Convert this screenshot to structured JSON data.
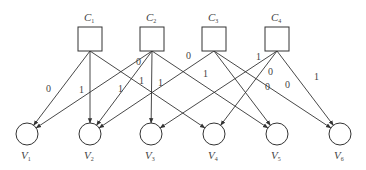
{
  "diagram": {
    "type": "bipartite-graph",
    "colors": {
      "stroke": "#333333",
      "text": "#444444",
      "background": "#ffffff"
    },
    "check_nodes": [
      {
        "id": "C1",
        "label": "C",
        "sub": "1",
        "x": 90,
        "y": 39
      },
      {
        "id": "C2",
        "label": "C",
        "sub": "2",
        "x": 152,
        "y": 39
      },
      {
        "id": "C3",
        "label": "C",
        "sub": "3",
        "x": 214,
        "y": 39
      },
      {
        "id": "C4",
        "label": "C",
        "sub": "4",
        "x": 277,
        "y": 39
      }
    ],
    "variable_nodes": [
      {
        "id": "V1",
        "label": "V",
        "sub": "1",
        "x": 27,
        "y": 134
      },
      {
        "id": "V2",
        "label": "V",
        "sub": "2",
        "x": 90,
        "y": 134
      },
      {
        "id": "V3",
        "label": "V",
        "sub": "3",
        "x": 151,
        "y": 134
      },
      {
        "id": "V4",
        "label": "V",
        "sub": "4",
        "x": 214,
        "y": 134
      },
      {
        "id": "V5",
        "label": "V",
        "sub": "5",
        "x": 277,
        "y": 134
      },
      {
        "id": "V6",
        "label": "V",
        "sub": "6",
        "x": 340,
        "y": 134
      }
    ],
    "edges": [
      {
        "from": "C1",
        "to": "V1",
        "label": "0",
        "lx": 46,
        "ly": 92
      },
      {
        "from": "C1",
        "to": "V2",
        "label": "1",
        "lx": 79,
        "ly": 93
      },
      {
        "from": "C1",
        "to": "V4",
        "label": "1",
        "lx": 118,
        "ly": 92
      },
      {
        "from": "C2",
        "to": "V1",
        "label": "1",
        "lx": 139,
        "ly": 84
      },
      {
        "from": "C2",
        "to": "V2",
        "label": "0",
        "lx": 136,
        "ly": 65
      },
      {
        "from": "C2",
        "to": "V3",
        "label": "1",
        "lx": 158,
        "ly": 86
      },
      {
        "from": "C2",
        "to": "V5",
        "label": "1",
        "lx": 203,
        "ly": 77
      },
      {
        "from": "C3",
        "to": "V2",
        "label": "0",
        "lx": 186,
        "ly": 59
      },
      {
        "from": "C3",
        "to": "V5",
        "label": "0",
        "lx": 265,
        "ly": 90
      },
      {
        "from": "C3",
        "to": "V6",
        "label": "0",
        "lx": 285,
        "ly": 88
      },
      {
        "from": "C4",
        "to": "V3",
        "label": "1",
        "lx": 256,
        "ly": 60
      },
      {
        "from": "C4",
        "to": "V4",
        "label": "0",
        "lx": 268,
        "ly": 75
      },
      {
        "from": "C4",
        "to": "V6",
        "label": "1",
        "lx": 314,
        "ly": 80
      }
    ]
  }
}
